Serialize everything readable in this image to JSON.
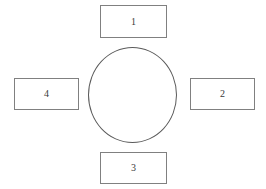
{
  "diagram": {
    "type": "radial-cycle",
    "background_color": "#ffffff",
    "center": {
      "shape": "ellipse",
      "label": "",
      "stroke_color": "#5a5a5a",
      "fill_color": "transparent"
    },
    "nodes": [
      {
        "id": "node-top",
        "label": "1",
        "position": "top",
        "stroke_color": "#808080",
        "fill_color": "#ffffff",
        "text_color": "#3a3a3a"
      },
      {
        "id": "node-right",
        "label": "2",
        "position": "right",
        "stroke_color": "#808080",
        "fill_color": "#ffffff",
        "text_color": "#3a3a3a"
      },
      {
        "id": "node-bottom",
        "label": "3",
        "position": "bottom",
        "stroke_color": "#808080",
        "fill_color": "#ffffff",
        "text_color": "#3a3a3a"
      },
      {
        "id": "node-left",
        "label": "4",
        "position": "left",
        "stroke_color": "#808080",
        "fill_color": "#ffffff",
        "text_color": "#3a3a3a"
      }
    ]
  }
}
